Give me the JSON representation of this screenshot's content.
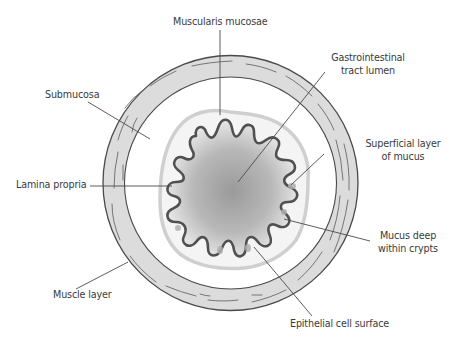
{
  "diagram": {
    "labels": {
      "muscularis_mucosae": "Muscularis mucosae",
      "gi_lumen_line1": "Gastrointestinal",
      "gi_lumen_line2": "tract lumen",
      "submucosa": "Submucosa",
      "superficial_mucus_line1": "Superficial layer",
      "superficial_mucus_line2": "of mucus",
      "lamina_propria": "Lamina propria",
      "mucus_crypts_line1": "Mucus deep",
      "mucus_crypts_line2": "within crypts",
      "muscle_layer": "Muscle layer",
      "epithelial_surface": "Epithelial cell surface"
    },
    "colors": {
      "ring_fill": "#dcdcdc",
      "ring_stroke": "#4a4a4a",
      "mucus_layer": "#c8c8c8",
      "epithelium_stroke": "#505050",
      "lumen_center": "#9a9a9a",
      "lumen_edge": "#e8e8e8",
      "leader_line": "#4a4a4a",
      "text": "#3a3a3a"
    }
  }
}
